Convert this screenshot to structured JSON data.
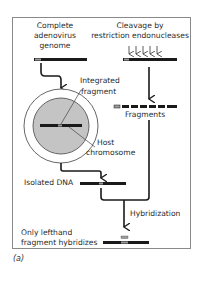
{
  "figure": {
    "caption": "(a)",
    "colors": {
      "frame": "#8a8a8a",
      "dna": "#1a1a1a",
      "adenovirus_segment": "#9a9a9a",
      "nucleus_fill": "#c4c4c4",
      "arrow": "#1a1a1a"
    }
  },
  "left_column": {
    "title_line1": "Complete",
    "title_line2": "adenovirus",
    "title_line3": "genome",
    "integrated_fragment_line1": "Integrated",
    "integrated_fragment_line2": "fragment",
    "host_chromosome_line1": "Host",
    "host_chromosome_line2": "chromosome",
    "isolated_dna": "Isolated DNA"
  },
  "right_column": {
    "title_line1": "Cleavage by",
    "title_line2": "restriction endonucleases",
    "fragments": "Fragments",
    "restriction_sites": 5,
    "fragment_count": 6
  },
  "bottom": {
    "hybridization": "Hybridization",
    "result_line1": "Only lefthand",
    "result_line2": "fragment hybridizes"
  }
}
